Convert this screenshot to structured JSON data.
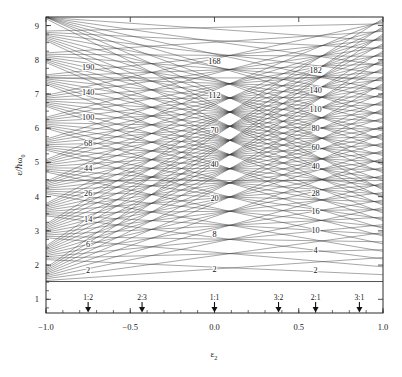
{
  "figure": {
    "kind": "nilsson-deformed-harmonic-oscillator-diagram",
    "caption": ""
  },
  "axes": {
    "x": {
      "label_main": "ε",
      "label_sub": "2",
      "min": -1.0,
      "max": 1.0,
      "ticks": [
        -1.0,
        -0.5,
        0.0,
        0.5,
        1.0
      ],
      "tick_labels": [
        "−1.0",
        "−0.5",
        "0.0",
        "0.5",
        "1.0"
      ],
      "minor_step": 0.1
    },
    "y": {
      "label_main": "ε/",
      "label_hbar": "ℏω",
      "label_sub": "0",
      "min": 0.6,
      "max": 9.25,
      "ticks": [
        1,
        2,
        3,
        4,
        5,
        6,
        7,
        8,
        9
      ],
      "tick_labels": [
        "1",
        "2",
        "3",
        "4",
        "5",
        "6",
        "7",
        "8",
        "9"
      ],
      "minor_step": 0.25
    }
  },
  "ratio_markers": [
    {
      "label": "1:2",
      "x": -0.75
    },
    {
      "label": "2:3",
      "x": -0.43
    },
    {
      "label": "1:1",
      "x": 0.0
    },
    {
      "label": "3:2",
      "x": 0.38
    },
    {
      "label": "2:1",
      "x": 0.6
    },
    {
      "label": "3:1",
      "x": 0.86
    }
  ],
  "chart_data": {
    "type": "line",
    "title": "",
    "xlabel": "ε₂",
    "ylabel": "ε/ℏω₀",
    "xlim": [
      -1.0,
      1.0
    ],
    "ylim": [
      0.6,
      9.25
    ],
    "grid": false,
    "legend": "none",
    "magic_number_columns": [
      {
        "name": "1:2 oblate shell closures",
        "x": -0.75,
        "labels": [
          "2",
          "6",
          "14",
          "26",
          "44",
          "68",
          "100",
          "140",
          "190"
        ],
        "values": [
          2,
          6,
          14,
          26,
          44,
          68,
          100,
          140,
          190
        ],
        "y": [
          1.85,
          2.62,
          3.35,
          4.1,
          4.85,
          5.58,
          6.32,
          7.05,
          7.8
        ]
      },
      {
        "name": "1:1 spherical shell closures",
        "x": 0.0,
        "labels": [
          "2",
          "8",
          "20",
          "40",
          "70",
          "112",
          "168"
        ],
        "values": [
          2,
          8,
          20,
          40,
          70,
          112,
          168
        ],
        "y": [
          1.88,
          2.92,
          3.95,
          4.95,
          5.95,
          6.97,
          7.95
        ]
      },
      {
        "name": "2:1 prolate shell closures",
        "x": 0.6,
        "labels": [
          "2",
          "4",
          "10",
          "16",
          "28",
          "40",
          "60",
          "80",
          "110",
          "140",
          "182"
        ],
        "values": [
          2,
          4,
          10,
          16,
          28,
          40,
          60,
          80,
          110,
          140,
          182
        ],
        "y": [
          1.87,
          2.45,
          3.02,
          3.57,
          4.12,
          4.9,
          5.45,
          6.0,
          6.55,
          7.12,
          7.7
        ]
      }
    ],
    "series_note": "Lines are single-particle orbitals e/hw0 = (n_perp+1)w_perp + (n_z+1/2)w_z, linear in eps2.",
    "levels": [
      {
        "n": 0,
        "y_left": 1.52,
        "y_right": 1.52,
        "heavy": true
      },
      {
        "n": 1,
        "y_left": 2.16,
        "y_right": 1.72
      },
      {
        "n": 1,
        "y_left": 1.55,
        "y_right": 2.22
      },
      {
        "n": 2,
        "y_left": 2.8,
        "y_right": 1.95
      },
      {
        "n": 2,
        "y_left": 2.2,
        "y_right": 2.45
      },
      {
        "n": 2,
        "y_left": 1.6,
        "y_right": 2.95
      },
      {
        "n": 3,
        "y_left": 3.44,
        "y_right": 2.18
      },
      {
        "n": 3,
        "y_left": 2.84,
        "y_right": 2.68
      },
      {
        "n": 3,
        "y_left": 2.24,
        "y_right": 3.18
      },
      {
        "n": 3,
        "y_left": 1.64,
        "y_right": 3.68
      },
      {
        "n": 4,
        "y_left": 4.08,
        "y_right": 2.4
      },
      {
        "n": 4,
        "y_left": 3.48,
        "y_right": 2.9
      },
      {
        "n": 4,
        "y_left": 2.88,
        "y_right": 3.4
      },
      {
        "n": 4,
        "y_left": 2.28,
        "y_right": 3.9
      },
      {
        "n": 4,
        "y_left": 1.68,
        "y_right": 4.4
      },
      {
        "n": 5,
        "y_left": 4.72,
        "y_right": 2.62
      },
      {
        "n": 5,
        "y_left": 4.12,
        "y_right": 3.12
      },
      {
        "n": 5,
        "y_left": 3.52,
        "y_right": 3.62
      },
      {
        "n": 5,
        "y_left": 2.92,
        "y_right": 4.12
      },
      {
        "n": 5,
        "y_left": 2.32,
        "y_right": 4.62
      },
      {
        "n": 5,
        "y_left": 1.72,
        "y_right": 5.12
      },
      {
        "n": 6,
        "y_left": 5.36,
        "y_right": 2.85
      },
      {
        "n": 6,
        "y_left": 4.76,
        "y_right": 3.35
      },
      {
        "n": 6,
        "y_left": 4.16,
        "y_right": 3.85
      },
      {
        "n": 6,
        "y_left": 3.56,
        "y_right": 4.35
      },
      {
        "n": 6,
        "y_left": 2.96,
        "y_right": 4.85
      },
      {
        "n": 6,
        "y_left": 2.36,
        "y_right": 5.35
      },
      {
        "n": 6,
        "y_left": 1.76,
        "y_right": 5.85
      },
      {
        "n": 7,
        "y_left": 6.0,
        "y_right": 3.07
      },
      {
        "n": 7,
        "y_left": 5.4,
        "y_right": 3.57
      },
      {
        "n": 7,
        "y_left": 4.8,
        "y_right": 4.07
      },
      {
        "n": 7,
        "y_left": 4.2,
        "y_right": 4.57
      },
      {
        "n": 7,
        "y_left": 3.6,
        "y_right": 5.07
      },
      {
        "n": 7,
        "y_left": 3.0,
        "y_right": 5.57
      },
      {
        "n": 7,
        "y_left": 2.4,
        "y_right": 6.07
      },
      {
        "n": 7,
        "y_left": 1.8,
        "y_right": 6.57
      },
      {
        "n": 8,
        "y_left": 6.64,
        "y_right": 3.3
      },
      {
        "n": 8,
        "y_left": 6.04,
        "y_right": 3.8
      },
      {
        "n": 8,
        "y_left": 5.44,
        "y_right": 4.3
      },
      {
        "n": 8,
        "y_left": 4.84,
        "y_right": 4.8
      },
      {
        "n": 8,
        "y_left": 4.24,
        "y_right": 5.3
      },
      {
        "n": 8,
        "y_left": 3.64,
        "y_right": 5.8
      },
      {
        "n": 8,
        "y_left": 3.04,
        "y_right": 6.3
      },
      {
        "n": 8,
        "y_left": 2.44,
        "y_right": 6.8
      },
      {
        "n": 8,
        "y_left": 1.84,
        "y_right": 7.3
      },
      {
        "n": 9,
        "y_left": 7.28,
        "y_right": 3.52
      },
      {
        "n": 9,
        "y_left": 6.68,
        "y_right": 4.02
      },
      {
        "n": 9,
        "y_left": 6.08,
        "y_right": 4.52
      },
      {
        "n": 9,
        "y_left": 5.48,
        "y_right": 5.02
      },
      {
        "n": 9,
        "y_left": 4.88,
        "y_right": 5.52
      },
      {
        "n": 9,
        "y_left": 4.28,
        "y_right": 6.02
      },
      {
        "n": 9,
        "y_left": 3.68,
        "y_right": 6.52
      },
      {
        "n": 9,
        "y_left": 3.08,
        "y_right": 7.02
      },
      {
        "n": 9,
        "y_left": 2.48,
        "y_right": 7.52
      },
      {
        "n": 9,
        "y_left": 1.88,
        "y_right": 8.02
      },
      {
        "n": 10,
        "y_left": 7.92,
        "y_right": 3.75
      },
      {
        "n": 10,
        "y_left": 7.32,
        "y_right": 4.25
      },
      {
        "n": 10,
        "y_left": 6.72,
        "y_right": 4.75
      },
      {
        "n": 10,
        "y_left": 6.12,
        "y_right": 5.25
      },
      {
        "n": 10,
        "y_left": 5.52,
        "y_right": 5.75
      },
      {
        "n": 10,
        "y_left": 4.92,
        "y_right": 6.25
      },
      {
        "n": 10,
        "y_left": 4.32,
        "y_right": 6.75
      },
      {
        "n": 10,
        "y_left": 3.72,
        "y_right": 7.25
      },
      {
        "n": 10,
        "y_left": 3.12,
        "y_right": 7.75
      },
      {
        "n": 10,
        "y_left": 2.52,
        "y_right": 8.25
      },
      {
        "n": 10,
        "y_left": 1.92,
        "y_right": 8.75
      },
      {
        "n": 11,
        "y_left": 8.56,
        "y_right": 3.97
      },
      {
        "n": 11,
        "y_left": 7.96,
        "y_right": 4.47
      },
      {
        "n": 11,
        "y_left": 7.36,
        "y_right": 4.97
      },
      {
        "n": 11,
        "y_left": 6.76,
        "y_right": 5.47
      },
      {
        "n": 11,
        "y_left": 6.16,
        "y_right": 5.97
      },
      {
        "n": 11,
        "y_left": 5.56,
        "y_right": 6.47
      },
      {
        "n": 11,
        "y_left": 4.96,
        "y_right": 6.97
      },
      {
        "n": 11,
        "y_left": 4.36,
        "y_right": 7.47
      },
      {
        "n": 11,
        "y_left": 3.76,
        "y_right": 7.97
      },
      {
        "n": 11,
        "y_left": 3.16,
        "y_right": 8.47
      },
      {
        "n": 11,
        "y_left": 2.56,
        "y_right": 8.97
      },
      {
        "n": 12,
        "y_left": 9.2,
        "y_right": 4.2
      },
      {
        "n": 12,
        "y_left": 8.6,
        "y_right": 4.7
      },
      {
        "n": 12,
        "y_left": 8.0,
        "y_right": 5.2
      },
      {
        "n": 12,
        "y_left": 7.4,
        "y_right": 5.7
      },
      {
        "n": 12,
        "y_left": 6.8,
        "y_right": 6.2
      },
      {
        "n": 12,
        "y_left": 6.2,
        "y_right": 6.7
      },
      {
        "n": 12,
        "y_left": 5.6,
        "y_right": 7.2
      },
      {
        "n": 12,
        "y_left": 5.0,
        "y_right": 7.7
      },
      {
        "n": 12,
        "y_left": 4.4,
        "y_right": 8.2
      },
      {
        "n": 12,
        "y_left": 3.8,
        "y_right": 8.7
      },
      {
        "n": 12,
        "y_left": 3.2,
        "y_right": 9.2
      },
      {
        "n": 13,
        "y_left": 9.24,
        "y_right": 4.92
      },
      {
        "n": 13,
        "y_left": 8.64,
        "y_right": 5.42
      },
      {
        "n": 13,
        "y_left": 8.04,
        "y_right": 5.92
      },
      {
        "n": 13,
        "y_left": 7.44,
        "y_right": 6.42
      },
      {
        "n": 13,
        "y_left": 6.84,
        "y_right": 6.92
      },
      {
        "n": 13,
        "y_left": 6.24,
        "y_right": 7.42
      },
      {
        "n": 13,
        "y_left": 5.64,
        "y_right": 7.92
      },
      {
        "n": 13,
        "y_left": 5.04,
        "y_right": 8.42
      },
      {
        "n": 13,
        "y_left": 4.44,
        "y_right": 8.92
      },
      {
        "n": 14,
        "y_left": 9.24,
        "y_right": 5.65
      },
      {
        "n": 14,
        "y_left": 8.68,
        "y_right": 6.15
      },
      {
        "n": 14,
        "y_left": 8.08,
        "y_right": 6.65
      },
      {
        "n": 14,
        "y_left": 7.48,
        "y_right": 7.15
      },
      {
        "n": 14,
        "y_left": 6.88,
        "y_right": 7.65
      },
      {
        "n": 14,
        "y_left": 6.28,
        "y_right": 8.15
      },
      {
        "n": 14,
        "y_left": 5.68,
        "y_right": 8.65
      },
      {
        "n": 14,
        "y_left": 5.08,
        "y_right": 9.15
      },
      {
        "n": 15,
        "y_left": 9.24,
        "y_right": 6.38
      },
      {
        "n": 15,
        "y_left": 8.72,
        "y_right": 6.88
      },
      {
        "n": 15,
        "y_left": 8.12,
        "y_right": 7.38
      },
      {
        "n": 15,
        "y_left": 7.52,
        "y_right": 7.88
      },
      {
        "n": 15,
        "y_left": 6.92,
        "y_right": 8.38
      },
      {
        "n": 15,
        "y_left": 6.32,
        "y_right": 8.88
      },
      {
        "n": 16,
        "y_left": 9.24,
        "y_right": 7.1
      },
      {
        "n": 16,
        "y_left": 8.76,
        "y_right": 7.6
      },
      {
        "n": 16,
        "y_left": 8.16,
        "y_right": 8.1
      },
      {
        "n": 16,
        "y_left": 7.56,
        "y_right": 8.6
      },
      {
        "n": 16,
        "y_left": 6.96,
        "y_right": 9.1
      },
      {
        "n": 17,
        "y_left": 9.24,
        "y_right": 7.83
      },
      {
        "n": 17,
        "y_left": 8.8,
        "y_right": 8.33
      },
      {
        "n": 17,
        "y_left": 8.2,
        "y_right": 8.83
      },
      {
        "n": 18,
        "y_left": 9.24,
        "y_right": 8.55
      },
      {
        "n": 18,
        "y_left": 8.84,
        "y_right": 9.05
      }
    ],
    "horizontal_guides": [
      1.52,
      4.47,
      7.47
    ]
  },
  "colors": {
    "background": "#ffffff",
    "axis": "#2b2b2b",
    "line": "#3a3a3a",
    "text": "#1a1a1a"
  }
}
